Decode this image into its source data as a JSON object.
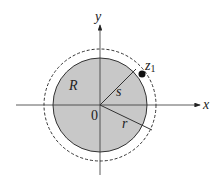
{
  "diagram": {
    "axes": {
      "x_label": "x",
      "y_label": "y",
      "origin_label": "0"
    },
    "region_label": "R",
    "inner_radius_label": "s",
    "outer_radius_label": "r",
    "point_label": "z",
    "point_subscript": "1",
    "colors": {
      "disk_fill": "#c8c8c8",
      "stroke": "#222222"
    }
  }
}
